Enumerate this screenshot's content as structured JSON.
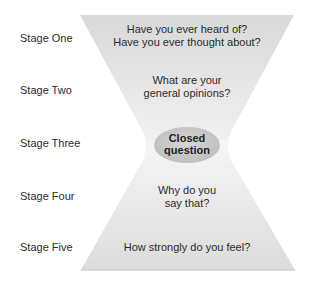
{
  "diagram": {
    "stages": [
      {
        "label": "Stage One",
        "question_lines": [
          "Have you ever heard of?",
          "Have you ever thought about?"
        ]
      },
      {
        "label": "Stage Two",
        "question_lines": [
          "What are your",
          "general opinions?"
        ]
      },
      {
        "label": "Stage Three",
        "question_lines": [
          "Closed",
          "question"
        ]
      },
      {
        "label": "Stage Four",
        "question_lines": [
          "Why do you",
          "say that?"
        ]
      },
      {
        "label": "Stage Five",
        "question_lines": [
          "How strongly do you feel?"
        ]
      }
    ],
    "colors": {
      "funnel_fill_top": "#dcdcdc",
      "funnel_fill_bottom": "#f2f2f2",
      "ellipse_fill": "#c8c8c8",
      "text": "#2b2b2b"
    }
  }
}
